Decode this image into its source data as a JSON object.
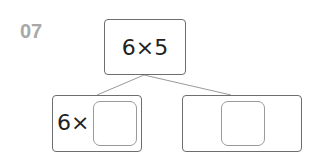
{
  "problem_number": "07",
  "root": {
    "expression": "6×5"
  },
  "branches": [
    {
      "prefix": "6×",
      "blank": ""
    },
    {
      "prefix": "",
      "blank": ""
    }
  ],
  "colors": {
    "number": "#a8a8a8",
    "border": "#6e6e6e",
    "line": "#9a9a9a"
  }
}
